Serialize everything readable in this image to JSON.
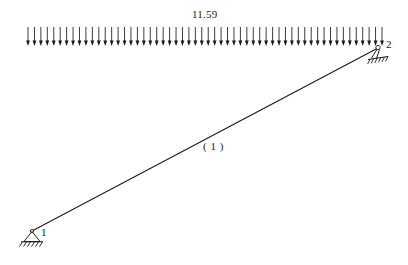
{
  "figure": {
    "background_color": "#ffffff",
    "line_color": "#1a1a1a"
  },
  "load": {
    "magnitude_label": "11.59",
    "type": "uniformly-distributed-load",
    "direction": "downward",
    "arrow_count": 56,
    "span_start_x": 28,
    "span_end_x": 382,
    "baseline_y": 46,
    "arrow_top_y": 27
  },
  "member": {
    "label": "( 1 )",
    "id": "1",
    "start_node": "1",
    "end_node": "2",
    "start_x": 32,
    "start_y": 231,
    "end_x": 378,
    "end_y": 48
  },
  "nodes": [
    {
      "id": "1",
      "label": "1",
      "x": 32,
      "y": 231,
      "support_type": "pinned-support",
      "label_x": 41,
      "label_y": 226
    },
    {
      "id": "2",
      "label": "2",
      "x": 378,
      "y": 48,
      "support_type": "inclined-roller-support",
      "label_x": 386,
      "label_y": 38
    }
  ],
  "chart_data": {
    "type": "diagram",
    "elements": [
      {
        "name": "distributed-load",
        "value": "11.59",
        "from": "node 1 end",
        "to": "node 2 end"
      },
      {
        "name": "member",
        "label": "( 1 )"
      },
      {
        "name": "node-1",
        "label": "1",
        "support": "pinned"
      },
      {
        "name": "node-2",
        "label": "2",
        "support": "roller"
      }
    ]
  }
}
